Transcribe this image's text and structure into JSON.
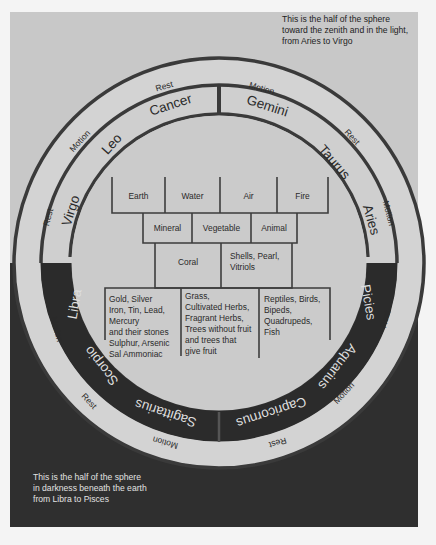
{
  "title_notes": {
    "top": [
      "This is the half of the sphere",
      "toward the zenith and in the light,",
      "from Aries to Virgo"
    ],
    "bottom": [
      "This is the half of the sphere",
      "in darkness beneath the earth",
      "from Libra to Pisces"
    ]
  },
  "outer_ring": {
    "labels_upper": [
      "Rest",
      "Motion",
      "Motion",
      "Rest",
      "Rest",
      "Motion"
    ],
    "labels_lower": [
      "Motion",
      "Rest",
      "Motion",
      "Rest",
      "Motion",
      "Rest"
    ],
    "items": [
      {
        "label": "Rest",
        "angle": -104
      },
      {
        "label": "Motion",
        "angle": -76
      },
      {
        "label": "Rest",
        "angle": -45
      },
      {
        "label": "Motion",
        "angle": -17
      },
      {
        "label": "Rest",
        "angle": 14
      },
      {
        "label": "Motion",
        "angle": 45
      },
      {
        "label": "Rest",
        "angle": 76
      },
      {
        "label": "Motion",
        "angle": 104
      },
      {
        "label": "Rest",
        "angle": 135
      },
      {
        "label": "Motion",
        "angle": 166
      },
      {
        "label": "Rest",
        "angle": 194
      },
      {
        "label": "Motion",
        "angle": 225
      }
    ]
  },
  "zodiac": {
    "upper": [
      "Virgo",
      "Leo",
      "Cancer",
      "Gemini",
      "Taurus",
      "Aries"
    ],
    "lower": [
      "Libra",
      "Scorpio",
      "Sagittarius",
      "Capricornus",
      "Aquarius",
      "Picies"
    ]
  },
  "grid": {
    "elements": [
      "Earth",
      "Water",
      "Air",
      "Fire"
    ],
    "kingdoms": [
      "Mineral",
      "Vegetable",
      "Animal"
    ],
    "intermediates": [
      "Coral",
      "Shells, Pearl,\nVitriols"
    ],
    "examples": {
      "mineral": [
        "Gold, Silver",
        "Iron, Tin, Lead,",
        "Mercury",
        "and their stones",
        "Sulphur, Arsenic",
        "Sal Ammoniac"
      ],
      "vegetable": [
        "Grass,",
        "Cultivated Herbs,",
        "Fragrant Herbs,",
        "Trees without fruit",
        "and trees that",
        "give fruit"
      ],
      "animal": [
        "Reptiles, Birds,",
        "Bipeds,",
        "Quadrupeds,",
        "Fish"
      ]
    }
  },
  "colors": {
    "light_bg": "#c8c8c8",
    "dark_bg": "#2f2f2f",
    "ring_light": "#d2d2d2",
    "line": "#333333"
  }
}
